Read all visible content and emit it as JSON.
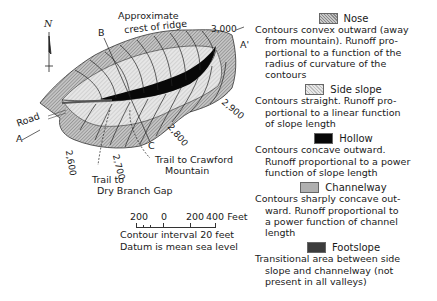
{
  "figure": {
    "map_labels": {
      "ridge_crest": [
        "Approximate",
        "crest of ridge"
      ],
      "section_b": "B",
      "section_a": "A",
      "section_a_prime": "A'",
      "section_c": "C",
      "road": "Road",
      "north": "N",
      "trail_crawford": [
        "Trail to Crawford",
        "Mountain"
      ],
      "trail_dry_branch": [
        "Trail to",
        "Dry Branch Gap"
      ]
    },
    "elevations": [
      "3,000",
      "2,900",
      "2,800",
      "2,700",
      "2,600"
    ],
    "scale": {
      "ticks": [
        "200",
        "0",
        "200",
        "400 Feet"
      ],
      "contour_interval": "Contour interval 20 feet",
      "datum": "Datum is mean sea level"
    },
    "colors": {
      "nose": "#9a9a9a",
      "side_slope": "#d8d8d8",
      "hollow": "#080808",
      "channelway": "#b0b0b0",
      "footslope": "#3c3c3c"
    }
  },
  "legend": [
    {
      "key": "nose",
      "title": "Nose",
      "lines": [
        "Contours convex outward (away",
        "from mountain). Runoff pro-",
        "portional to a function of the",
        "radius of curvature of the",
        "contours"
      ]
    },
    {
      "key": "side",
      "title": "Side slope",
      "lines": [
        "Contours straight. Runoff pro-",
        "portional to a linear function",
        "of slope length"
      ]
    },
    {
      "key": "hollow",
      "title": "Hollow",
      "lines": [
        "Contours concave outward.",
        "Runoff proportional to a power",
        "function of slope length"
      ]
    },
    {
      "key": "channel",
      "title": "Channelway",
      "lines": [
        "Contours sharply concave out-",
        "ward. Runoff proportional to",
        "a power function of channel",
        "length"
      ]
    },
    {
      "key": "foot",
      "title": "Footslope",
      "lines": [
        "Transitional area between side",
        "slope and channelway (not",
        "present in all valleys)"
      ]
    }
  ]
}
